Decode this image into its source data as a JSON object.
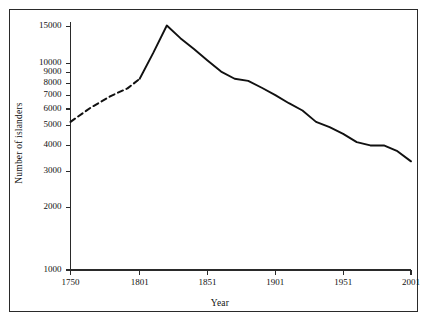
{
  "chart_data": {
    "type": "line",
    "title": "",
    "xlabel": "Year",
    "ylabel": "Number of islanders",
    "yscale": "log",
    "ylim": [
      1000,
      15800
    ],
    "xlim": [
      1750,
      2001
    ],
    "grid": false,
    "legend": null,
    "ytick_labels": [
      "15000",
      "10000",
      "9000",
      "8000",
      "7000",
      "6000",
      "5000",
      "4000",
      "3000",
      "2000",
      "1000"
    ],
    "ytick_values": [
      15000,
      10000,
      9000,
      8000,
      7000,
      6000,
      5000,
      4000,
      3000,
      2000,
      1000
    ],
    "xtick_labels": [
      "1750",
      "1801",
      "1851",
      "1901",
      "1951",
      "2001"
    ],
    "xtick_values": [
      1750,
      1801,
      1851,
      1901,
      1951,
      2001
    ],
    "series": [
      {
        "name": "Islander population (estimated)",
        "style": "dashed",
        "x": [
          1750,
          1765,
          1780,
          1792,
          1801
        ],
        "values": [
          5200,
          6100,
          6950,
          7550,
          8400
        ]
      },
      {
        "name": "Islander population (recorded)",
        "style": "solid",
        "x": [
          1801,
          1811,
          1821,
          1831,
          1841,
          1851,
          1861,
          1871,
          1881,
          1891,
          1901,
          1911,
          1921,
          1931,
          1941,
          1951,
          1961,
          1971,
          1981,
          1991,
          2001
        ],
        "values": [
          8400,
          11200,
          15200,
          13200,
          11700,
          10300,
          9100,
          8400,
          8200,
          7600,
          7000,
          6400,
          5900,
          5200,
          4900,
          4550,
          4150,
          4000,
          4000,
          3750,
          3350
        ]
      }
    ],
    "annotations": []
  },
  "figure": {
    "axis_color": "#2a2a2a",
    "line_color": "#111111",
    "background": "#ffffff"
  }
}
